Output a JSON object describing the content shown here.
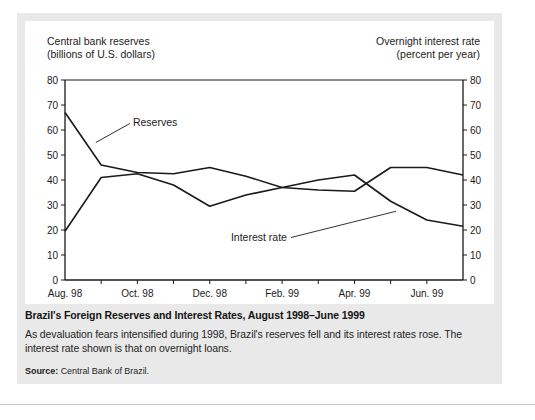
{
  "figure": {
    "left_axis_title": "Central bank reserves\n(billions of U.S. dollars)",
    "right_axis_title": "Overnight interest rate\n(percent per year)",
    "caption_title": "Brazil's Foreign Reserves and Interest Rates, August 1998–June 1999",
    "caption_body": "As devaluation fears intensified during 1998, Brazil's reserves fell and its interest rates rose. The interest rate shown is that on overnight loans.",
    "source_label": "Source:",
    "source_text": "Central Bank of Brazil."
  },
  "chart_data": {
    "type": "line",
    "title": "Brazil's Foreign Reserves and Interest Rates, August 1998–June 1999",
    "xlabel": "",
    "ylabel": "Central bank reserves (billions of U.S. dollars)",
    "y2label": "Overnight interest rate (percent per year)",
    "ylim": [
      0,
      80
    ],
    "y2lim": [
      0,
      80
    ],
    "yticks": [
      0,
      10,
      20,
      30,
      40,
      50,
      60,
      70,
      80
    ],
    "y2ticks": [
      0,
      10,
      20,
      30,
      40,
      50,
      60,
      70,
      80
    ],
    "grid": false,
    "legend": "inline-annotations",
    "x": [
      "Aug. 98",
      "Sep. 98",
      "Oct. 98",
      "Nov. 98",
      "Dec. 98",
      "Jan. 99",
      "Feb. 99",
      "Mar. 99",
      "Apr. 99",
      "May 99",
      "Jun. 99",
      "Jul. 99"
    ],
    "xtick_labels": [
      "Aug. 98",
      "Oct. 98",
      "Dec. 98",
      "Feb. 99",
      "Apr. 99",
      "Jun. 99"
    ],
    "xtick_indices": [
      0,
      2,
      4,
      6,
      8,
      10
    ],
    "series": [
      {
        "name": "Reserves",
        "axis": "left",
        "color": "#1a1a1a",
        "values": [
          67,
          46,
          43,
          42.5,
          45,
          41.5,
          37,
          36,
          35.5,
          45,
          45,
          42
        ]
      },
      {
        "name": "Interest rate",
        "axis": "right",
        "color": "#1a1a1a",
        "values": [
          19.5,
          41,
          42.5,
          38,
          29.5,
          34,
          37,
          40,
          42,
          31.5,
          24,
          21.5
        ]
      }
    ],
    "annotations": [
      {
        "text": "Reserves",
        "x_index": 1.6,
        "y_value": 63
      },
      {
        "text": "Interest rate",
        "x_index": 6.3,
        "y_value": 17
      }
    ]
  }
}
